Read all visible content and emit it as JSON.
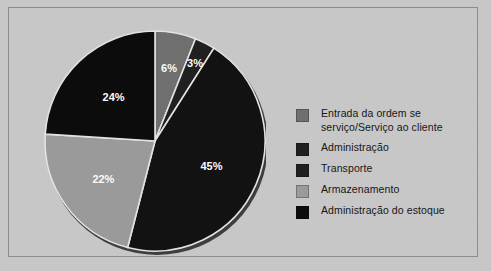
{
  "frame": {
    "background_color": "#c9c9c9",
    "border_color": "#8c8c8c"
  },
  "chart_data": {
    "type": "pie",
    "title": "",
    "subtitle": "",
    "xlabel": "",
    "ylabel": "",
    "legend_position": "right",
    "grid": false,
    "categories": [
      "Entrada da ordem se serviço/Serviço ao cliente",
      "Administração",
      "Transporte",
      "Armazenamento",
      "Administração do estoque"
    ],
    "values": [
      6,
      3,
      45,
      22,
      24
    ],
    "value_labels": [
      "6%",
      "3%",
      "45%",
      "22%",
      "24%"
    ],
    "colors": [
      "#6e6e6e",
      "#1b1b1b",
      "#0d0d0d",
      "#9a9a9a",
      "#070707"
    ],
    "start_angle_deg": 0,
    "direction": "clockwise",
    "slices": [
      {
        "label": "Entrada da ordem se serviço/Serviço ao cliente",
        "value": 6,
        "value_label": "6%",
        "color": "#6e6e6e"
      },
      {
        "label": "Administração",
        "value": 3,
        "value_label": "3%",
        "color": "#1b1b1b"
      },
      {
        "label": "Transporte",
        "value": 45,
        "value_label": "45%",
        "color": "#0d0d0d"
      },
      {
        "label": "Armazenamento",
        "value": 22,
        "value_label": "22%",
        "color": "#9a9a9a"
      },
      {
        "label": "Administração do estoque",
        "value": 24,
        "value_label": "24%",
        "color": "#070707"
      }
    ]
  },
  "legend": {
    "items": [
      {
        "label": "Entrada da ordem se\nserviço/Serviço ao cliente",
        "color": "#6e6e6e"
      },
      {
        "label": "Administração",
        "color": "#1b1b1b"
      },
      {
        "label": "Transporte",
        "color": "#1b1b1b"
      },
      {
        "label": "Armazenamento",
        "color": "#9a9a9a"
      },
      {
        "label": "Administração do estoque",
        "color": "#070707"
      }
    ]
  }
}
